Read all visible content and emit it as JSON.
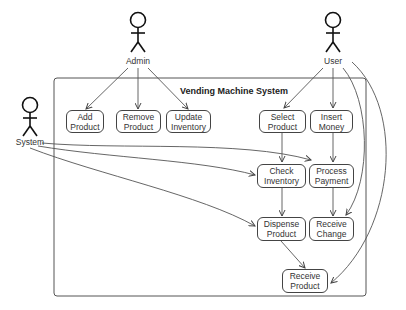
{
  "diagram": {
    "type": "use-case",
    "system_title": "Vending Machine System",
    "actors": [
      {
        "id": "admin",
        "label": "Admin"
      },
      {
        "id": "user",
        "label": "User"
      },
      {
        "id": "system",
        "label": "System"
      }
    ],
    "use_cases": [
      {
        "id": "add_product",
        "label": "Add\nProduct"
      },
      {
        "id": "remove_product",
        "label": "Remove\nProduct"
      },
      {
        "id": "update_inventory",
        "label": "Update\nInventory"
      },
      {
        "id": "select_product",
        "label": "Select\nProduct"
      },
      {
        "id": "insert_money",
        "label": "Insert\nMoney"
      },
      {
        "id": "check_inventory",
        "label": "Check\nInventory"
      },
      {
        "id": "process_payment",
        "label": "Process\nPayment"
      },
      {
        "id": "dispense_product",
        "label": "Dispense\nProduct"
      },
      {
        "id": "receive_change",
        "label": "Receive\nChange"
      },
      {
        "id": "receive_product",
        "label": "Receive\nProduct"
      }
    ],
    "edges": [
      [
        "admin",
        "add_product"
      ],
      [
        "admin",
        "remove_product"
      ],
      [
        "admin",
        "update_inventory"
      ],
      [
        "user",
        "select_product"
      ],
      [
        "user",
        "insert_money"
      ],
      [
        "user",
        "receive_change"
      ],
      [
        "user",
        "receive_product"
      ],
      [
        "system",
        "check_inventory"
      ],
      [
        "system",
        "process_payment"
      ],
      [
        "system",
        "dispense_product"
      ],
      [
        "select_product",
        "check_inventory"
      ],
      [
        "insert_money",
        "process_payment"
      ],
      [
        "check_inventory",
        "dispense_product"
      ],
      [
        "process_payment",
        "receive_change"
      ],
      [
        "dispense_product",
        "receive_product"
      ]
    ]
  }
}
